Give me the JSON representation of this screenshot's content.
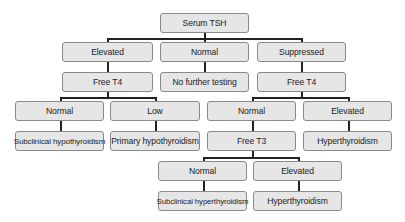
{
  "diagram": {
    "root": {
      "label": "Serum TSH"
    },
    "level1": [
      {
        "label": "Elevated"
      },
      {
        "label": "Normal"
      },
      {
        "label": "Suppressed"
      }
    ],
    "level2": [
      {
        "label": "Free T4"
      },
      {
        "label": "No further testing"
      },
      {
        "label": "Free T4"
      }
    ],
    "level3": [
      {
        "label": "Normal"
      },
      {
        "label": "Low"
      },
      {
        "label": "Normal"
      },
      {
        "label": "Elevated"
      }
    ],
    "level4": [
      {
        "label": "Subclinical hypothyroidism"
      },
      {
        "label": "Primary hypothyroidism"
      },
      {
        "label": "Free T3"
      },
      {
        "label": "Hyperthyroidism"
      }
    ],
    "level5": [
      {
        "label": "Normal"
      },
      {
        "label": "Elevated"
      }
    ],
    "level6": [
      {
        "label": "Subclinical hyperthyroidism"
      },
      {
        "label": "Hyperthyroidism"
      }
    ],
    "edges": [
      [
        "Serum TSH",
        "Elevated"
      ],
      [
        "Serum TSH",
        "Normal"
      ],
      [
        "Serum TSH",
        "Suppressed"
      ],
      [
        "Elevated",
        "Free T4"
      ],
      [
        "Normal",
        "No further testing"
      ],
      [
        "Suppressed",
        "Free T4"
      ],
      [
        "Free T4 (elevated TSH)",
        "Normal"
      ],
      [
        "Free T4 (elevated TSH)",
        "Low"
      ],
      [
        "Normal",
        "Subclinical hypothyroidism"
      ],
      [
        "Low",
        "Primary hypothyroidism"
      ],
      [
        "Free T4 (suppressed TSH)",
        "Normal"
      ],
      [
        "Free T4 (suppressed TSH)",
        "Elevated"
      ],
      [
        "Normal",
        "Free T3"
      ],
      [
        "Elevated",
        "Hyperthyroidism"
      ],
      [
        "Free T3",
        "Normal"
      ],
      [
        "Free T3",
        "Elevated"
      ],
      [
        "Normal",
        "Subclinical hyperthyroidism"
      ],
      [
        "Elevated",
        "Hyperthyroidism"
      ]
    ],
    "colors": {
      "node_fill": "#e6e6e6",
      "node_border": "#8a8a8a",
      "connector": "#222222"
    }
  }
}
